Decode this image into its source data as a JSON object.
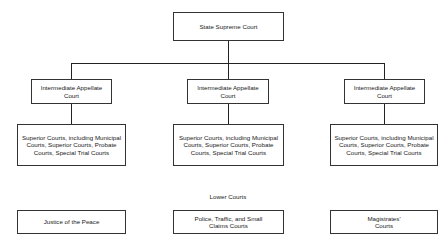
{
  "diagram": {
    "root": {
      "label": "State Supreme Court"
    },
    "intermediate": [
      {
        "label": "Intermediate Appellate Court"
      },
      {
        "label": "Intermediate Appellate Court"
      },
      {
        "label": "Intermediate Appellate Court"
      }
    ],
    "superior": [
      {
        "label": "Superior Courts, including Municipal Courts, Superior Courts, Probate Courts, Special Trial Courts"
      },
      {
        "label": "Superior Courts, including Municipal Courts, Superior Courts, Probate Courts, Special Trial Courts"
      },
      {
        "label": "Superior Courts, including Municipal Courts, Superior Courts, Probate Courts, Special Trial Courts"
      }
    ],
    "lower_heading": "Lower Courts",
    "lower": [
      {
        "label": "Justice of the Peace"
      },
      {
        "label": "Police, Traffic, and Small Claims Courts"
      },
      {
        "label": "Magistrates' Courts"
      }
    ]
  }
}
